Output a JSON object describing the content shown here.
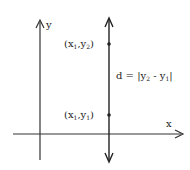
{
  "diagram": {
    "axis_labels": {
      "x": "x",
      "y": "y"
    },
    "points": [
      {
        "id": "p2",
        "label_base": "(x",
        "label_sub1": "1",
        "label_mid": ",y",
        "label_sub2": "2",
        "label_end": ")"
      },
      {
        "id": "p1",
        "label_base": "(x",
        "label_sub1": "1",
        "label_mid": ",y",
        "label_sub2": "1",
        "label_end": ")"
      }
    ],
    "distance_label": {
      "prefix": "d = |y",
      "sub1": "2",
      "mid": " - y",
      "sub2": "1",
      "suffix": "|"
    },
    "colors": {
      "ink": "#222222",
      "background": "#ffffff"
    }
  }
}
